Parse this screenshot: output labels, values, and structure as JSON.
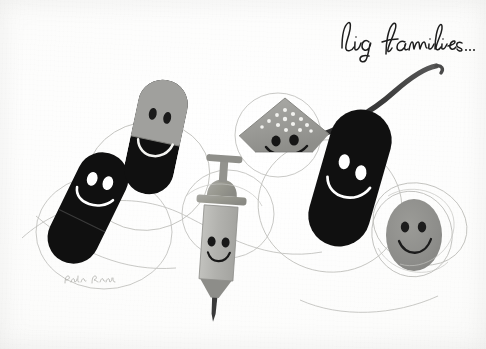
{
  "artwork": {
    "title_script": "big families...",
    "signature": "Paul Rand",
    "medium_note": "illustration",
    "canvas": {
      "width": 486,
      "height": 349,
      "paper_color": "#fbfbfa",
      "ink_color": "#111111",
      "gray_color": "#9a9a98",
      "pencil_line_color": "#b9b9b6"
    }
  },
  "palette": {
    "paper": "#fbfbfa",
    "black": "#101010",
    "capsule_gray": "#a0a09d",
    "spoon_gray": "#9d9d99",
    "syringe_gray": "#b4b4b0",
    "pill_gray": "#8f8f8c",
    "pencil": "#bcbcb8",
    "script_ink": "#1d1d1d"
  },
  "figures": [
    {
      "id": "capsule-black-left",
      "name": "black capsule with smiley face",
      "type": "capsule",
      "fill": "#101010",
      "face": "white eyes and white smile",
      "rotation_deg": 26,
      "center": [
        88,
        208
      ],
      "size": [
        52,
        118
      ]
    },
    {
      "id": "capsule-two-tone",
      "name": "two-tone capsule with smiley face",
      "type": "capsule",
      "fill_top": "#a0a09d",
      "fill_bottom": "#101010",
      "face": "dark eyes on gray cap, white smile on black body",
      "rotation_deg": 12,
      "center": [
        156,
        137
      ],
      "size": [
        50,
        116
      ]
    },
    {
      "id": "spoon-powder",
      "name": "spoon of powder with smiley face",
      "type": "spoon",
      "fill": "#9d9d99",
      "face": "dark eyes and dark smile",
      "detail": "white powder dots in bowl, long dark curved handle sweeping to upper right",
      "center": [
        285,
        130
      ]
    },
    {
      "id": "syringe",
      "name": "syringe with smiley face",
      "type": "syringe",
      "fill": "#b4b4b0",
      "face": "dark eyes and dark smile on barrel",
      "detail": "T-shaped plunger top, flange wings, dark needle pointing down",
      "center": [
        220,
        235
      ]
    },
    {
      "id": "capsule-black-right",
      "name": "large black capsule with smiley face",
      "type": "capsule",
      "fill": "#101010",
      "face": "white eyes and white smile",
      "rotation_deg": 16,
      "center": [
        350,
        178
      ],
      "size": [
        62,
        140
      ]
    },
    {
      "id": "pill-oval-gray",
      "name": "small gray oval pill with smiley face",
      "type": "oval-pill",
      "fill": "#8f8f8c",
      "face": "dark eyes and dark smile",
      "center": [
        414,
        235
      ],
      "size": [
        56,
        72
      ]
    }
  ],
  "background_marks": {
    "name": "loose pencil circle outlines",
    "description": "thin overlapping hand-drawn circles and loops behind the figures",
    "count": 9
  }
}
